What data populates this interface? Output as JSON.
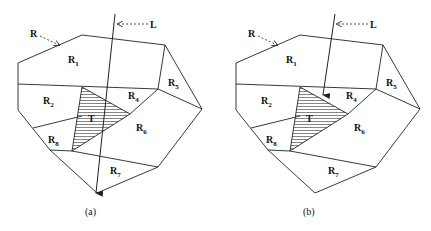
{
  "panels": [
    {
      "id": "a",
      "caption": "(a)",
      "ray_label": "L",
      "region_pointer_label": "R",
      "triangle_label": "T",
      "regions": [
        {
          "name": "R",
          "sub": "1"
        },
        {
          "name": "R",
          "sub": "2"
        },
        {
          "name": "R",
          "sub": "4"
        },
        {
          "name": "R",
          "sub": "5"
        },
        {
          "name": "R",
          "sub": "6"
        },
        {
          "name": "R",
          "sub": "7"
        },
        {
          "name": "R",
          "sub": "8"
        }
      ],
      "ray_description": "Line L passes through the entire polygon and through triangle T, exiting at the bottom"
    },
    {
      "id": "b",
      "caption": "(b)",
      "ray_label": "L",
      "region_pointer_label": "R",
      "triangle_label": "T",
      "regions": [
        {
          "name": "R",
          "sub": "1"
        },
        {
          "name": "R",
          "sub": "2"
        },
        {
          "name": "R",
          "sub": "4"
        },
        {
          "name": "R",
          "sub": "5"
        },
        {
          "name": "R",
          "sub": "6"
        },
        {
          "name": "R",
          "sub": "7"
        },
        {
          "name": "R",
          "sub": "8"
        }
      ],
      "ray_description": "Line L stops at the top vertex of triangle T"
    }
  ]
}
